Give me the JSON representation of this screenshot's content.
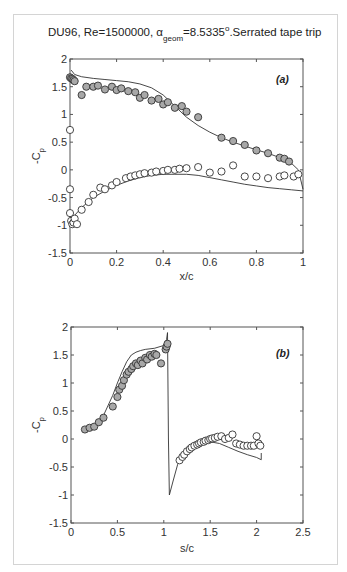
{
  "figure": {
    "title_main": "DU96, Re=1500000, α",
    "title_sub": "geom",
    "title_rest": "=8.5335",
    "title_deg": "o",
    "title_end": ".Serrated tape trip"
  },
  "chart_data": [
    {
      "type": "scatter",
      "panel_label": "(a)",
      "title": "DU96, Re=1500000, α_geom=8.5335°. Serrated tape trip",
      "xlabel": "x/c",
      "ylabel": "-C_p",
      "xlim": [
        0,
        1
      ],
      "ylim": [
        -1.5,
        2
      ],
      "xticks": [
        "0",
        "0.2",
        "0.4",
        "0.6",
        "0.8",
        "1"
      ],
      "yticks": [
        "-1.5",
        "-1",
        "-0.5",
        "0",
        "0.5",
        "1",
        "1.5",
        "2"
      ],
      "grid": false,
      "series": [
        {
          "name": "Experiment suction side",
          "style": "filled-grey-circle",
          "x": [
            0.0,
            0.005,
            0.01,
            0.015,
            0.02,
            0.05,
            0.07,
            0.1,
            0.12,
            0.15,
            0.18,
            0.2,
            0.22,
            0.25,
            0.28,
            0.3,
            0.32,
            0.35,
            0.38,
            0.4,
            0.42,
            0.45,
            0.48,
            0.5,
            0.55,
            0.65,
            0.7,
            0.75,
            0.8,
            0.85,
            0.9,
            0.92,
            0.94
          ],
          "y": [
            1.67,
            1.65,
            1.64,
            1.62,
            1.6,
            1.35,
            1.5,
            1.5,
            1.52,
            1.45,
            1.5,
            1.44,
            1.47,
            1.42,
            1.4,
            1.3,
            1.35,
            1.25,
            1.28,
            1.18,
            1.22,
            1.12,
            1.15,
            1.05,
            0.95,
            0.58,
            0.52,
            0.45,
            0.35,
            0.3,
            0.22,
            0.2,
            0.15
          ]
        },
        {
          "name": "Experiment pressure side",
          "style": "open-circle",
          "x": [
            0.0,
            0.0,
            0.0,
            0.005,
            0.01,
            0.015,
            0.02,
            0.03,
            0.05,
            0.08,
            0.1,
            0.13,
            0.15,
            0.18,
            0.2,
            0.24,
            0.26,
            0.28,
            0.3,
            0.32,
            0.35,
            0.37,
            0.4,
            0.42,
            0.45,
            0.47,
            0.5,
            0.55,
            0.6,
            0.65,
            0.7,
            0.75,
            0.8,
            0.85,
            0.9,
            0.92,
            0.96,
            0.98
          ],
          "y": [
            0.72,
            -0.35,
            -0.78,
            -0.92,
            -0.98,
            -0.95,
            -0.88,
            -0.98,
            -0.72,
            -0.58,
            -0.45,
            -0.32,
            -0.35,
            -0.28,
            -0.22,
            -0.15,
            -0.12,
            -0.1,
            -0.08,
            -0.06,
            -0.05,
            -0.03,
            -0.02,
            0.0,
            0.0,
            0.02,
            0.03,
            0.05,
            -0.05,
            -0.03,
            0.08,
            -0.12,
            -0.12,
            -0.15,
            -0.12,
            -0.1,
            -0.12,
            -0.08
          ]
        },
        {
          "name": "Computation",
          "style": "line",
          "x": [
            0.005,
            0.02,
            0.05,
            0.1,
            0.15,
            0.2,
            0.25,
            0.3,
            0.35,
            0.4,
            0.45,
            0.5,
            0.55,
            0.6,
            0.65,
            0.7,
            0.75,
            0.8,
            0.85,
            0.9,
            0.95,
            0.98,
            1.0
          ],
          "y": [
            1.8,
            1.72,
            1.68,
            1.65,
            1.63,
            1.61,
            1.59,
            1.55,
            1.48,
            1.35,
            1.15,
            0.95,
            0.8,
            0.68,
            0.58,
            0.5,
            0.43,
            0.36,
            0.3,
            0.22,
            0.12,
            0.0,
            -0.35
          ]
        },
        {
          "name": "Computation pressure side",
          "style": "line",
          "x": [
            0.0,
            0.02,
            0.05,
            0.1,
            0.15,
            0.2,
            0.25,
            0.3,
            0.35,
            0.4,
            0.45,
            0.5,
            0.55,
            0.6,
            0.65,
            0.7,
            0.75,
            0.8,
            0.85,
            0.9,
            0.95,
            1.0
          ],
          "y": [
            -0.98,
            -0.82,
            -0.68,
            -0.5,
            -0.38,
            -0.28,
            -0.2,
            -0.14,
            -0.1,
            -0.08,
            -0.08,
            -0.08,
            -0.1,
            -0.14,
            -0.18,
            -0.22,
            -0.26,
            -0.29,
            -0.32,
            -0.34,
            -0.36,
            -0.38
          ]
        }
      ]
    },
    {
      "type": "scatter",
      "panel_label": "(b)",
      "xlabel": "s/c",
      "ylabel": "-C_p",
      "xlim": [
        0,
        2.5
      ],
      "ylim": [
        -1.5,
        2
      ],
      "xticks": [
        "0",
        "0.5",
        "1",
        "1.5",
        "2",
        "2.5"
      ],
      "yticks": [
        "-1.5",
        "-1",
        "-0.5",
        "0",
        "0.5",
        "1",
        "1.5",
        "2"
      ],
      "grid": false,
      "series": [
        {
          "name": "Experiment suction side",
          "style": "filled-grey-circle",
          "x": [
            0.15,
            0.2,
            0.25,
            0.3,
            0.35,
            0.45,
            0.5,
            0.52,
            0.55,
            0.57,
            0.6,
            0.62,
            0.65,
            0.67,
            0.7,
            0.72,
            0.75,
            0.77,
            0.8,
            0.82,
            0.85,
            0.87,
            0.9,
            0.92,
            0.97,
            1.02,
            1.03,
            1.04
          ],
          "y": [
            0.17,
            0.2,
            0.22,
            0.3,
            0.38,
            0.58,
            0.75,
            0.88,
            0.95,
            1.05,
            1.15,
            1.2,
            1.25,
            1.3,
            1.35,
            1.32,
            1.4,
            1.35,
            1.45,
            1.42,
            1.5,
            1.47,
            1.52,
            1.5,
            1.35,
            1.6,
            1.65,
            1.7
          ]
        },
        {
          "name": "Experiment pressure side",
          "style": "open-circle",
          "x": [
            1.17,
            1.2,
            1.22,
            1.25,
            1.28,
            1.3,
            1.33,
            1.36,
            1.38,
            1.4,
            1.43,
            1.45,
            1.48,
            1.5,
            1.52,
            1.55,
            1.58,
            1.62,
            1.66,
            1.7,
            1.74,
            1.78,
            1.82,
            1.86,
            1.9,
            1.94,
            1.97,
            2.0,
            2.02,
            2.04
          ],
          "y": [
            -0.38,
            -0.32,
            -0.28,
            -0.22,
            -0.18,
            -0.15,
            -0.12,
            -0.1,
            -0.08,
            -0.06,
            -0.05,
            -0.03,
            -0.02,
            0.0,
            0.01,
            0.02,
            0.04,
            0.05,
            0.0,
            0.02,
            0.08,
            -0.08,
            -0.1,
            -0.12,
            -0.12,
            -0.12,
            -0.12,
            0.05,
            -0.08,
            -0.12
          ]
        },
        {
          "name": "Computation",
          "style": "line",
          "x": [
            0.15,
            0.25,
            0.35,
            0.45,
            0.5,
            0.55,
            0.6,
            0.65,
            0.7,
            0.75,
            0.8,
            0.9,
            1.0,
            1.03,
            1.04,
            1.05,
            1.06,
            1.1,
            1.15,
            1.2,
            1.3,
            1.4,
            1.5,
            1.6,
            1.7,
            1.8,
            1.9,
            2.0,
            2.05,
            2.05
          ],
          "y": [
            0.12,
            0.22,
            0.42,
            0.78,
            1.0,
            1.2,
            1.38,
            1.5,
            1.55,
            1.58,
            1.6,
            1.62,
            1.67,
            1.78,
            1.9,
            0.0,
            -1.0,
            -0.75,
            -0.45,
            -0.3,
            -0.15,
            -0.08,
            -0.05,
            -0.08,
            -0.15,
            -0.22,
            -0.28,
            -0.33,
            -0.37,
            -0.25
          ]
        }
      ]
    }
  ]
}
